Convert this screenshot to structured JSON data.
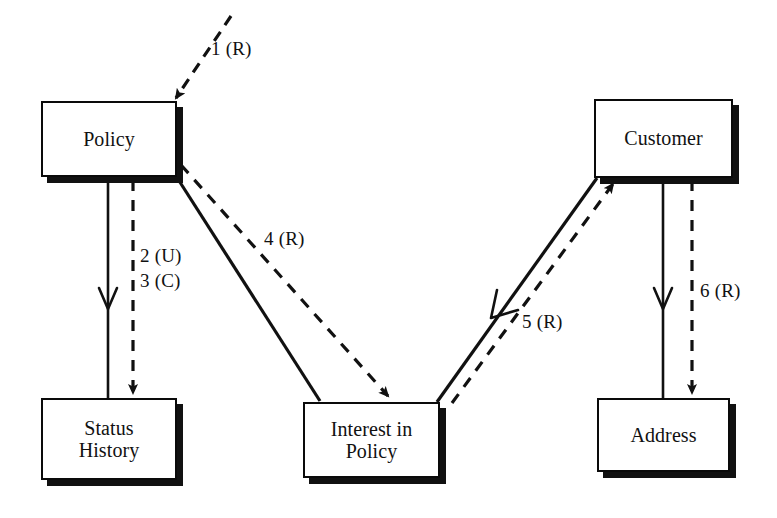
{
  "diagram": {
    "background_color": "#ffffff",
    "line_color": "#111111",
    "nodes": [
      {
        "id": "policy",
        "label": "Policy",
        "x": 41,
        "y": 101,
        "w": 136,
        "h": 76
      },
      {
        "id": "customer",
        "label": "Customer",
        "x": 594,
        "y": 99,
        "w": 139,
        "h": 79
      },
      {
        "id": "status",
        "label": "Status\nHistory",
        "x": 41,
        "y": 398,
        "w": 136,
        "h": 82
      },
      {
        "id": "interest",
        "label": "Interest in\nPolicy",
        "x": 303,
        "y": 402,
        "w": 137,
        "h": 76
      },
      {
        "id": "address",
        "label": "Address",
        "x": 597,
        "y": 398,
        "w": 133,
        "h": 74
      }
    ],
    "edges": [
      {
        "id": "e1",
        "label": "1 (R)",
        "style": "dashed",
        "arrow": "filled",
        "from": "external",
        "to": "policy",
        "label_x": 211,
        "label_y": 38
      },
      {
        "id": "e2",
        "label": "2 (U)",
        "style": "solid",
        "arrow": "open",
        "from": "policy",
        "to": "status",
        "label_x": 140,
        "label_y": 245
      },
      {
        "id": "e3",
        "label": "3 (C)",
        "style": "dashed",
        "arrow": "filled",
        "from": "policy",
        "to": "status",
        "label_x": 140,
        "label_y": 270
      },
      {
        "id": "e4",
        "label": "4 (R)",
        "style": "dashed",
        "arrow": "filled",
        "from": "policy",
        "to": "interest",
        "label_x": 264,
        "label_y": 228
      },
      {
        "id": "e5",
        "label": "5 (R)",
        "style": "dashed",
        "arrow": "filled",
        "from": "interest",
        "to": "customer",
        "label_x": 522,
        "label_y": 311
      },
      {
        "id": "e6",
        "label": "6 (R)",
        "style": "dashed",
        "arrow": "filled",
        "from": "customer",
        "to": "address",
        "label_x": 700,
        "label_y": 280
      }
    ]
  }
}
